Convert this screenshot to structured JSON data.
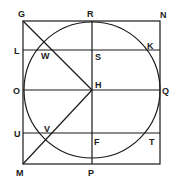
{
  "diagram": {
    "type": "geometry",
    "stroke_color": "#1a1a1a",
    "points": {
      "G": "G",
      "R": "R",
      "N": "N",
      "L": "L",
      "W": "W",
      "S": "S",
      "K": "K",
      "O": "O",
      "H": "H",
      "Q": "Q",
      "U": "U",
      "V": "V",
      "F": "F",
      "T": "T",
      "M": "M",
      "P": "P"
    }
  }
}
